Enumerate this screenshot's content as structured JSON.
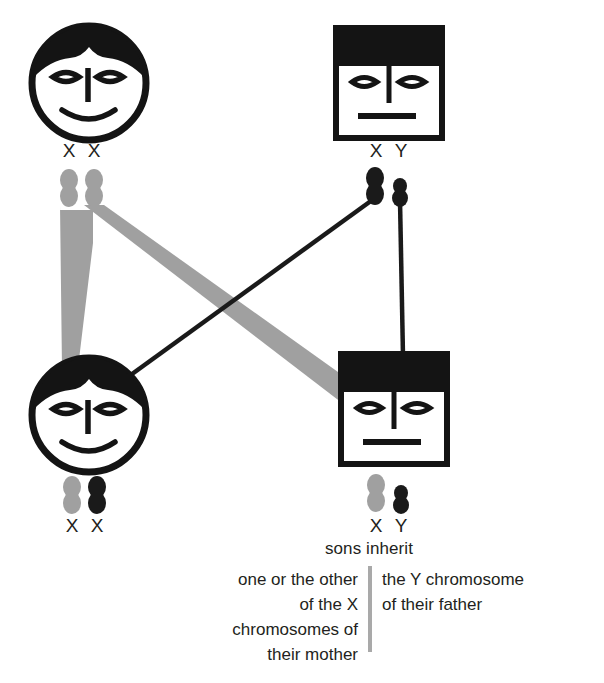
{
  "diagram": {
    "colors": {
      "maternal_gray": "#a0a0a0",
      "paternal_black": "#1a1a1a",
      "ink": "#231f20",
      "divider_gray": "#a9a9a9",
      "background": "#ffffff"
    },
    "figures": [
      {
        "id": "mother",
        "role": "mother",
        "shape": "circle",
        "generation": "parent",
        "position": "top-left",
        "karyotype_label": "X X",
        "chromosomes": [
          {
            "label": "X",
            "color": "#a0a0a0",
            "type": "X",
            "origin": "maternal"
          },
          {
            "label": "X",
            "color": "#a0a0a0",
            "type": "X",
            "origin": "maternal"
          }
        ]
      },
      {
        "id": "father",
        "role": "father",
        "shape": "square",
        "generation": "parent",
        "position": "top-right",
        "karyotype_label": "X Y",
        "chromosomes": [
          {
            "label": "X",
            "color": "#1a1a1a",
            "type": "X",
            "origin": "paternal"
          },
          {
            "label": "Y",
            "color": "#1a1a1a",
            "type": "Y",
            "origin": "paternal"
          }
        ]
      },
      {
        "id": "daughter",
        "role": "daughter",
        "shape": "circle",
        "generation": "child",
        "position": "bottom-left",
        "karyotype_label": "X X",
        "chromosomes": [
          {
            "label": "X",
            "color": "#a0a0a0",
            "type": "X",
            "origin": "maternal"
          },
          {
            "label": "X",
            "color": "#1a1a1a",
            "type": "X",
            "origin": "paternal"
          }
        ]
      },
      {
        "id": "son",
        "role": "son",
        "shape": "square",
        "generation": "child",
        "position": "bottom-right",
        "karyotype_label": "X Y",
        "chromosomes": [
          {
            "label": "X",
            "color": "#a0a0a0",
            "type": "X",
            "origin": "maternal"
          },
          {
            "label": "Y",
            "color": "#1a1a1a",
            "type": "Y",
            "origin": "paternal"
          }
        ]
      }
    ],
    "chromosome_labels": {
      "mother_left": "X",
      "mother_right": "X",
      "father_left": "X",
      "father_right": "Y",
      "daughter_left": "X",
      "daughter_right": "X",
      "son_left": "X",
      "son_right": "Y"
    },
    "inheritance_links": [
      {
        "from": "mother-x-left",
        "to": "daughter",
        "color": "#a0a0a0",
        "style": "thick"
      },
      {
        "from": "mother-x-right",
        "to": "son",
        "color": "#a0a0a0",
        "style": "thick"
      },
      {
        "from": "father-x",
        "to": "daughter",
        "color": "#1a1a1a",
        "style": "thin"
      },
      {
        "from": "father-y",
        "to": "son",
        "color": "#1a1a1a",
        "style": "thin"
      }
    ]
  },
  "caption": {
    "heading": "sons inherit",
    "left_lines": [
      "one or the other",
      "of the X",
      "chromosomes of",
      "their mother"
    ],
    "right_lines": [
      "the Y chromosome",
      "of their father"
    ]
  }
}
